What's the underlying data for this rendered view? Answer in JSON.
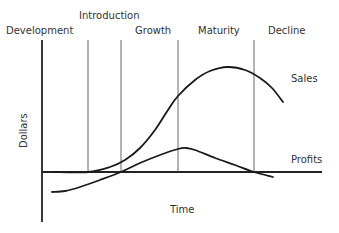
{
  "chart_data": {
    "type": "line",
    "title": "",
    "xlabel": "Time",
    "ylabel": "Dollars",
    "stages": [
      "Development",
      "Introduction",
      "Growth",
      "Maturity",
      "Decline"
    ],
    "stage_boundaries_px": [
      88,
      121,
      178,
      254
    ],
    "series": [
      {
        "name": "Sales",
        "points_px": [
          [
            52,
            172
          ],
          [
            88,
            172
          ],
          [
            110,
            167
          ],
          [
            125,
            160
          ],
          [
            140,
            148
          ],
          [
            155,
            130
          ],
          [
            168,
            110
          ],
          [
            178,
            96
          ],
          [
            195,
            80
          ],
          [
            210,
            71
          ],
          [
            228,
            67
          ],
          [
            245,
            70
          ],
          [
            260,
            78
          ],
          [
            272,
            88
          ],
          [
            283,
            102
          ]
        ]
      },
      {
        "name": "Profits",
        "points_px": [
          [
            52,
            192
          ],
          [
            65,
            191
          ],
          [
            80,
            187
          ],
          [
            100,
            180
          ],
          [
            121,
            172
          ],
          [
            140,
            163
          ],
          [
            160,
            155
          ],
          [
            178,
            149
          ],
          [
            186,
            148
          ],
          [
            195,
            150
          ],
          [
            215,
            158
          ],
          [
            235,
            165
          ],
          [
            254,
            172
          ],
          [
            273,
            177
          ]
        ]
      }
    ],
    "grid": false,
    "legend": "inline labels at right"
  },
  "labels": {
    "stage_development": "Development",
    "stage_introduction": "Introduction",
    "stage_growth": "Growth",
    "stage_maturity": "Maturity",
    "stage_decline": "Decline",
    "series_sales": "Sales",
    "series_profits": "Profits",
    "x_axis": "Time",
    "y_axis": "Dollars"
  },
  "colors": {
    "axis": "#222222",
    "curve": "#1a1a1a",
    "divider": "#555555",
    "text": "#333333"
  }
}
